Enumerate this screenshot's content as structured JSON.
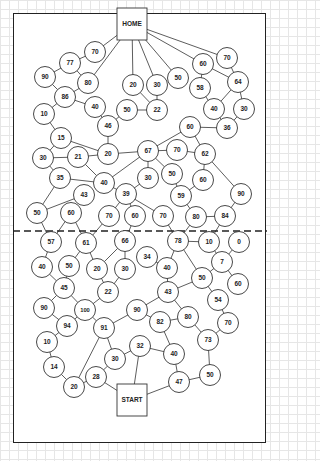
{
  "diagram": {
    "type": "maze-path-puzzle",
    "home_label": "HOME",
    "start_label": "START",
    "colors": {
      "line": "#333333",
      "node_fill": "#ffffff",
      "text": "#222222",
      "grid": "#e6e6e6"
    },
    "frame": {
      "x": 13,
      "y": 13,
      "w": 253,
      "h": 430
    },
    "divider_y": 231,
    "boxes": [
      {
        "id": "HOME",
        "label": "HOME",
        "x": 117,
        "y": 8,
        "w": 30,
        "h": 32
      },
      {
        "id": "START",
        "label": "START",
        "x": 117,
        "y": 384,
        "w": 30,
        "h": 32
      }
    ],
    "nodes": [
      {
        "id": "n70a",
        "label": "70",
        "x": 95,
        "y": 52
      },
      {
        "id": "n77",
        "label": "77",
        "x": 70,
        "y": 63
      },
      {
        "id": "n90a",
        "label": "90",
        "x": 45,
        "y": 77
      },
      {
        "id": "n80a",
        "label": "80",
        "x": 88,
        "y": 83
      },
      {
        "id": "n86",
        "label": "86",
        "x": 65,
        "y": 97
      },
      {
        "id": "n40a",
        "label": "40",
        "x": 95,
        "y": 107
      },
      {
        "id": "n10a",
        "label": "10",
        "x": 44,
        "y": 114
      },
      {
        "id": "n20a",
        "label": "20",
        "x": 133,
        "y": 85
      },
      {
        "id": "n30a",
        "label": "30",
        "x": 157,
        "y": 85
      },
      {
        "id": "n50a",
        "label": "50",
        "x": 178,
        "y": 78
      },
      {
        "id": "n60a",
        "label": "60",
        "x": 203,
        "y": 64
      },
      {
        "id": "n70b",
        "label": "70",
        "x": 227,
        "y": 58
      },
      {
        "id": "n58",
        "label": "58",
        "x": 200,
        "y": 88
      },
      {
        "id": "n64",
        "label": "64",
        "x": 238,
        "y": 82
      },
      {
        "id": "n50b",
        "label": "50",
        "x": 127,
        "y": 110
      },
      {
        "id": "n22a",
        "label": "22",
        "x": 157,
        "y": 110
      },
      {
        "id": "n46",
        "label": "46",
        "x": 108,
        "y": 126
      },
      {
        "id": "n40b",
        "label": "40",
        "x": 214,
        "y": 109
      },
      {
        "id": "n30b",
        "label": "30",
        "x": 244,
        "y": 109
      },
      {
        "id": "n60b",
        "label": "60",
        "x": 190,
        "y": 127
      },
      {
        "id": "n36",
        "label": "36",
        "x": 227,
        "y": 128
      },
      {
        "id": "n15",
        "label": "15",
        "x": 61,
        "y": 138
      },
      {
        "id": "n30c",
        "label": "30",
        "x": 43,
        "y": 158
      },
      {
        "id": "n21",
        "label": "21",
        "x": 78,
        "y": 157
      },
      {
        "id": "n20b",
        "label": "20",
        "x": 108,
        "y": 154
      },
      {
        "id": "n67",
        "label": "67",
        "x": 148,
        "y": 151
      },
      {
        "id": "n70c",
        "label": "70",
        "x": 177,
        "y": 150
      },
      {
        "id": "n62",
        "label": "62",
        "x": 205,
        "y": 154
      },
      {
        "id": "n35",
        "label": "35",
        "x": 60,
        "y": 178
      },
      {
        "id": "n40c",
        "label": "40",
        "x": 104,
        "y": 183
      },
      {
        "id": "n30d",
        "label": "30",
        "x": 148,
        "y": 178
      },
      {
        "id": "n50c",
        "label": "50",
        "x": 172,
        "y": 174
      },
      {
        "id": "n60c",
        "label": "60",
        "x": 203,
        "y": 180
      },
      {
        "id": "n43a",
        "label": "43",
        "x": 84,
        "y": 195
      },
      {
        "id": "n39",
        "label": "39",
        "x": 126,
        "y": 194
      },
      {
        "id": "n59",
        "label": "59",
        "x": 181,
        "y": 196
      },
      {
        "id": "n90b",
        "label": "90",
        "x": 241,
        "y": 194
      },
      {
        "id": "n50d",
        "label": "50",
        "x": 37,
        "y": 213
      },
      {
        "id": "n60d",
        "label": "60",
        "x": 71,
        "y": 213
      },
      {
        "id": "n70d",
        "label": "70",
        "x": 109,
        "y": 216
      },
      {
        "id": "n60e",
        "label": "60",
        "x": 135,
        "y": 216
      },
      {
        "id": "n70e",
        "label": "70",
        "x": 163,
        "y": 216
      },
      {
        "id": "n80b",
        "label": "80",
        "x": 196,
        "y": 217
      },
      {
        "id": "n84",
        "label": "84",
        "x": 225,
        "y": 216
      },
      {
        "id": "n57",
        "label": "57",
        "x": 51,
        "y": 242
      },
      {
        "id": "n61",
        "label": "61",
        "x": 86,
        "y": 243
      },
      {
        "id": "n66",
        "label": "66",
        "x": 125,
        "y": 241
      },
      {
        "id": "n78",
        "label": "78",
        "x": 178,
        "y": 241
      },
      {
        "id": "n10b",
        "label": "10",
        "x": 209,
        "y": 242
      },
      {
        "id": "n0",
        "label": "0",
        "x": 239,
        "y": 242
      },
      {
        "id": "n34",
        "label": "34",
        "x": 147,
        "y": 257
      },
      {
        "id": "n40d",
        "label": "40",
        "x": 42,
        "y": 267
      },
      {
        "id": "n50e",
        "label": "50",
        "x": 69,
        "y": 266
      },
      {
        "id": "n20c",
        "label": "20",
        "x": 97,
        "y": 269
      },
      {
        "id": "n30e",
        "label": "30",
        "x": 125,
        "y": 269
      },
      {
        "id": "n40e",
        "label": "40",
        "x": 167,
        "y": 268
      },
      {
        "id": "n7",
        "label": "7",
        "x": 222,
        "y": 262
      },
      {
        "id": "n50f",
        "label": "50",
        "x": 202,
        "y": 278
      },
      {
        "id": "n60f",
        "label": "60",
        "x": 238,
        "y": 284
      },
      {
        "id": "n45",
        "label": "45",
        "x": 64,
        "y": 288
      },
      {
        "id": "n22b",
        "label": "22",
        "x": 108,
        "y": 292
      },
      {
        "id": "n43b",
        "label": "43",
        "x": 168,
        "y": 292
      },
      {
        "id": "n54",
        "label": "54",
        "x": 218,
        "y": 300
      },
      {
        "id": "n90c",
        "label": "90",
        "x": 44,
        "y": 308
      },
      {
        "id": "n100",
        "label": "100",
        "x": 85,
        "y": 310
      },
      {
        "id": "n90d",
        "label": "90",
        "x": 137,
        "y": 310
      },
      {
        "id": "n82",
        "label": "82",
        "x": 160,
        "y": 322
      },
      {
        "id": "n80c",
        "label": "80",
        "x": 188,
        "y": 317
      },
      {
        "id": "n70f",
        "label": "70",
        "x": 228,
        "y": 323
      },
      {
        "id": "n94",
        "label": "94",
        "x": 67,
        "y": 326
      },
      {
        "id": "n91",
        "label": "91",
        "x": 104,
        "y": 328
      },
      {
        "id": "n10c",
        "label": "10",
        "x": 47,
        "y": 342
      },
      {
        "id": "n73",
        "label": "73",
        "x": 208,
        "y": 340
      },
      {
        "id": "n32",
        "label": "32",
        "x": 140,
        "y": 346
      },
      {
        "id": "n40f",
        "label": "40",
        "x": 174,
        "y": 354
      },
      {
        "id": "n30f",
        "label": "30",
        "x": 115,
        "y": 359
      },
      {
        "id": "n14",
        "label": "14",
        "x": 54,
        "y": 367
      },
      {
        "id": "n28",
        "label": "28",
        "x": 96,
        "y": 377
      },
      {
        "id": "n20d",
        "label": "20",
        "x": 74,
        "y": 387
      },
      {
        "id": "n50g",
        "label": "50",
        "x": 210,
        "y": 375
      },
      {
        "id": "n47",
        "label": "47",
        "x": 179,
        "y": 382
      }
    ],
    "edges": [
      [
        "HOME",
        "n70a"
      ],
      [
        "HOME",
        "n80a"
      ],
      [
        "HOME",
        "n20a"
      ],
      [
        "HOME",
        "n30a"
      ],
      [
        "HOME",
        "n50a"
      ],
      [
        "HOME",
        "n60a"
      ],
      [
        "HOME",
        "n70b"
      ],
      [
        "n70a",
        "n77"
      ],
      [
        "n77",
        "n90a"
      ],
      [
        "n77",
        "n80a"
      ],
      [
        "n90a",
        "n86"
      ],
      [
        "n80a",
        "n86"
      ],
      [
        "n86",
        "n40a"
      ],
      [
        "n86",
        "n10a"
      ],
      [
        "n40a",
        "n46"
      ],
      [
        "n46",
        "n50b"
      ],
      [
        "n46",
        "n20b"
      ],
      [
        "n50b",
        "n22a"
      ],
      [
        "n20a",
        "n22a"
      ],
      [
        "n30a",
        "n22a"
      ],
      [
        "n60a",
        "n58"
      ],
      [
        "n60a",
        "n64"
      ],
      [
        "n70b",
        "n64"
      ],
      [
        "n58",
        "n40b"
      ],
      [
        "n64",
        "n40b"
      ],
      [
        "n64",
        "n30b"
      ],
      [
        "n40b",
        "n36"
      ],
      [
        "n30b",
        "n36"
      ],
      [
        "n60b",
        "n36"
      ],
      [
        "n60b",
        "n67"
      ],
      [
        "n60b",
        "n62"
      ],
      [
        "n10a",
        "n15"
      ],
      [
        "n15",
        "n30c"
      ],
      [
        "n15",
        "n20b"
      ],
      [
        "n30c",
        "n21"
      ],
      [
        "n30c",
        "n35"
      ],
      [
        "n21",
        "n20b"
      ],
      [
        "n21",
        "n40c"
      ],
      [
        "n20b",
        "n67"
      ],
      [
        "n67",
        "n70c"
      ],
      [
        "n70c",
        "n62"
      ],
      [
        "n67",
        "n40c"
      ],
      [
        "n67",
        "n30d"
      ],
      [
        "n67",
        "n50c"
      ],
      [
        "n35",
        "n40c"
      ],
      [
        "n35",
        "n50d"
      ],
      [
        "n43a",
        "n50d"
      ],
      [
        "n40c",
        "n39"
      ],
      [
        "n30d",
        "n39"
      ],
      [
        "n50c",
        "n59"
      ],
      [
        "n60c",
        "n62"
      ],
      [
        "n60c",
        "n59"
      ],
      [
        "n62",
        "n90b"
      ],
      [
        "n90b",
        "n84"
      ],
      [
        "n59",
        "n80b"
      ],
      [
        "n80b",
        "n84"
      ],
      [
        "n39",
        "n70d"
      ],
      [
        "n39",
        "n60e"
      ],
      [
        "n39",
        "n70e"
      ],
      [
        "n50d",
        "n57"
      ],
      [
        "n60d",
        "n57"
      ],
      [
        "n60d",
        "n61"
      ],
      [
        "n70d",
        "n61"
      ],
      [
        "n60e",
        "n66"
      ],
      [
        "n70e",
        "n78"
      ],
      [
        "n80b",
        "n78"
      ],
      [
        "n84",
        "n10b"
      ],
      [
        "n57",
        "n40d"
      ],
      [
        "n61",
        "n50e"
      ],
      [
        "n61",
        "n20c"
      ],
      [
        "n66",
        "n20c"
      ],
      [
        "n66",
        "n30e"
      ],
      [
        "n78",
        "n10b"
      ],
      [
        "n78",
        "n40e"
      ],
      [
        "n78",
        "n50f"
      ],
      [
        "n10b",
        "n7"
      ],
      [
        "n0",
        "n7"
      ],
      [
        "n7",
        "n60f"
      ],
      [
        "n7",
        "n50f"
      ],
      [
        "n34",
        "n40e"
      ],
      [
        "n40d",
        "n45"
      ],
      [
        "n50e",
        "n45"
      ],
      [
        "n20c",
        "n22b"
      ],
      [
        "n30e",
        "n22b"
      ],
      [
        "n40e",
        "n43b"
      ],
      [
        "n50f",
        "n43b"
      ],
      [
        "n50f",
        "n54"
      ],
      [
        "n45",
        "n90c"
      ],
      [
        "n45",
        "n100"
      ],
      [
        "n22b",
        "n100"
      ],
      [
        "n100",
        "n94"
      ],
      [
        "n100",
        "n91"
      ],
      [
        "n90c",
        "n94"
      ],
      [
        "n94",
        "n10c"
      ],
      [
        "n43b",
        "n90d"
      ],
      [
        "n43b",
        "n80c"
      ],
      [
        "n90d",
        "n82"
      ],
      [
        "n90d",
        "n91"
      ],
      [
        "n82",
        "n80c"
      ],
      [
        "n82",
        "n40f"
      ],
      [
        "n80c",
        "n73"
      ],
      [
        "n54",
        "n70f"
      ],
      [
        "n70f",
        "n73"
      ],
      [
        "n91",
        "n20d"
      ],
      [
        "n91",
        "n30f"
      ],
      [
        "n10c",
        "n14"
      ],
      [
        "n14",
        "n20d"
      ],
      [
        "n20d",
        "n28"
      ],
      [
        "n28",
        "n30f"
      ],
      [
        "n30f",
        "n32"
      ],
      [
        "n32",
        "n40f"
      ],
      [
        "n32",
        "START"
      ],
      [
        "n28",
        "START"
      ],
      [
        "n40f",
        "n47"
      ],
      [
        "n73",
        "n50g"
      ],
      [
        "n50g",
        "n47"
      ],
      [
        "n47",
        "START"
      ]
    ]
  }
}
